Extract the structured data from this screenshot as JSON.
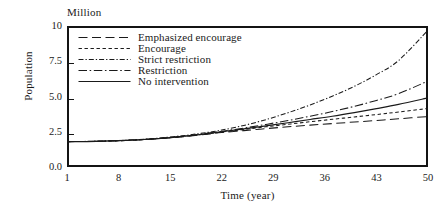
{
  "chart_data": {
    "type": "line",
    "title": "",
    "unit_caption": "Million",
    "xlabel": "Time (year)",
    "ylabel": "Population",
    "xlim": [
      1,
      50
    ],
    "ylim": [
      0.0,
      10.0
    ],
    "xticks": [
      "1",
      "8",
      "15",
      "22",
      "29",
      "36",
      "43",
      "50"
    ],
    "xtick_values": [
      1,
      8,
      15,
      22,
      29,
      36,
      43,
      50
    ],
    "yticks": [
      "0.0",
      "2.5",
      "5.0",
      "7.5",
      "10"
    ],
    "ytick_values": [
      0.0,
      2.5,
      5.0,
      7.5,
      10.0
    ],
    "grid": false,
    "legend_position": "upper-left-inside",
    "x": [
      1,
      5,
      9,
      13,
      17,
      20,
      22,
      25,
      28,
      31,
      34,
      37,
      40,
      43,
      46,
      50
    ],
    "series": [
      {
        "name": "Emphasized encourage",
        "dash": "long-dash",
        "color": "#1a1a1a",
        "values": [
          1.8,
          1.82,
          1.88,
          1.99,
          2.16,
          2.32,
          2.44,
          2.58,
          2.72,
          2.85,
          2.97,
          3.08,
          3.19,
          3.3,
          3.42,
          3.58
        ]
      },
      {
        "name": "Encourage",
        "dash": "short-dash",
        "color": "#1a1a1a",
        "values": [
          1.8,
          1.82,
          1.88,
          2.0,
          2.18,
          2.35,
          2.48,
          2.66,
          2.85,
          3.03,
          3.21,
          3.38,
          3.55,
          3.72,
          3.9,
          4.15
        ]
      },
      {
        "name": "Strict restriction",
        "dash": "dense-dash-dot",
        "color": "#1a1a1a",
        "values": [
          1.8,
          1.83,
          1.9,
          2.03,
          2.24,
          2.45,
          2.62,
          2.95,
          3.36,
          3.85,
          4.4,
          5.02,
          5.72,
          6.55,
          7.55,
          9.7
        ]
      },
      {
        "name": "Restriction",
        "dash": "dash-dot",
        "color": "#1a1a1a",
        "values": [
          1.8,
          1.82,
          1.89,
          2.01,
          2.2,
          2.39,
          2.53,
          2.76,
          3.02,
          3.3,
          3.6,
          3.93,
          4.3,
          4.72,
          5.2,
          6.1
        ]
      },
      {
        "name": "No intervention",
        "dash": "solid",
        "color": "#1a1a1a",
        "values": [
          1.8,
          1.82,
          1.89,
          2.0,
          2.19,
          2.37,
          2.5,
          2.7,
          2.92,
          3.14,
          3.37,
          3.6,
          3.86,
          4.14,
          4.44,
          4.9
        ]
      }
    ],
    "legend": [
      {
        "label": "Emphasized encourage",
        "dash": "long-dash"
      },
      {
        "label": "Encourage",
        "dash": "short-dash"
      },
      {
        "label": "Strict restriction",
        "dash": "dense-dash-dot"
      },
      {
        "label": "Restriction",
        "dash": "dash-dot"
      },
      {
        "label": "No intervention",
        "dash": "solid"
      }
    ]
  }
}
